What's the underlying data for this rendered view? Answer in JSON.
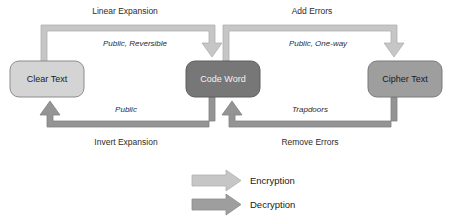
{
  "diagram": {
    "background_color": "#ffffff",
    "nodes": [
      {
        "id": "clear-text",
        "label": "Clear Text",
        "fill": "#d4d4d4",
        "stroke": "#8c8c8c",
        "text_color": "#1a1a1a",
        "x": 10,
        "y": 61,
        "w": 74,
        "h": 36,
        "r": 9
      },
      {
        "id": "code-word",
        "label": "Code Word",
        "fill": "#777777",
        "stroke": "#5e5e5e",
        "text_color": "#f2f2f2",
        "x": 186,
        "y": 61,
        "w": 74,
        "h": 36,
        "r": 9
      },
      {
        "id": "cipher-text",
        "label": "Cipher Text",
        "fill": "#9e9e9e",
        "stroke": "#7a7a7a",
        "text_color": "#1a1a1a",
        "x": 368,
        "y": 61,
        "w": 74,
        "h": 36,
        "r": 9
      }
    ],
    "edges": [
      {
        "id": "linear-expansion",
        "from": "clear-text",
        "to": "code-word",
        "direction": "down-into-target",
        "outer_label": "Linear Expansion",
        "inner_label": "Public, Reversible",
        "color": "#c2c2c2",
        "stroke": "#adadad"
      },
      {
        "id": "add-errors",
        "from": "code-word",
        "to": "cipher-text",
        "direction": "down-into-target",
        "outer_label": "Add Errors",
        "inner_label": "Public, One-way",
        "color": "#c2c2c2",
        "stroke": "#adadad"
      },
      {
        "id": "invert-expansion",
        "from": "code-word",
        "to": "clear-text",
        "direction": "up-into-target",
        "outer_label": "Invert Expansion",
        "inner_label": "Public",
        "color": "#8f8f8f",
        "stroke": "#7d7d7d"
      },
      {
        "id": "remove-errors",
        "from": "cipher-text",
        "to": "code-word",
        "direction": "up-into-target",
        "outer_label": "Remove Errors",
        "inner_label": "Trapdoors",
        "color": "#8f8f8f",
        "stroke": "#7d7d7d"
      }
    ],
    "labels": {
      "linear_expansion": "Linear Expansion",
      "add_errors": "Add Errors",
      "public_reversible": "Public, Reversible",
      "public_one_way": "Public, One-way",
      "public": "Public",
      "trapdoors": "Trapdoors",
      "invert_expansion": "Invert Expansion",
      "remove_errors": "Remove Errors"
    },
    "legend": {
      "items": [
        {
          "id": "encryption",
          "label": "Encryption",
          "color": "#c2c2c2",
          "stroke": "#adadad"
        },
        {
          "id": "decryption",
          "label": "Decryption",
          "color": "#9a9a9a",
          "stroke": "#8a8a8a"
        }
      ]
    }
  }
}
